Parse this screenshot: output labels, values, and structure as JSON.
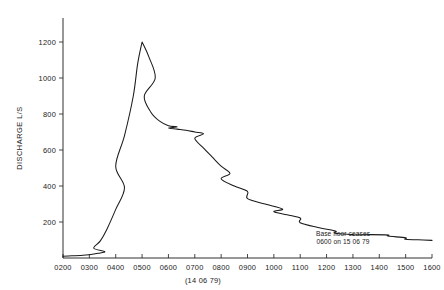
{
  "chart_data": {
    "type": "line",
    "title": "",
    "subtitle": "",
    "xlabel": "(14 06 79)",
    "ylabel": "DISCHARGE L/S",
    "xlim": [
      200,
      1600
    ],
    "ylim": [
      0,
      1240
    ],
    "grid": false,
    "legend_position": "none",
    "x_tick_labels": [
      "0200",
      "0300",
      "0400",
      "0500",
      "0600",
      "0700",
      "0800",
      "0900",
      "1000",
      "1100",
      "1200",
      "1300",
      "1400",
      "1500",
      "1600"
    ],
    "x_tick_values": [
      200,
      300,
      400,
      500,
      600,
      700,
      800,
      900,
      1000,
      1100,
      1200,
      1300,
      1400,
      1500,
      1600
    ],
    "y_tick_labels": [
      "200",
      "400",
      "600",
      "800",
      "1000",
      "1200"
    ],
    "y_tick_values": [
      200,
      400,
      600,
      800,
      1000,
      1200
    ],
    "series": [
      {
        "name": "Discharge",
        "units": "L/S",
        "x": [
          200,
          220,
          240,
          260,
          280,
          295,
          310,
          325,
          340,
          360,
          380,
          400,
          420,
          440,
          450,
          460,
          475,
          490,
          505,
          520,
          540,
          560,
          580,
          600,
          620,
          640,
          660,
          680,
          700,
          720,
          740,
          760,
          780,
          800,
          830,
          860,
          900,
          940,
          980,
          1000,
          1030,
          1060,
          1100,
          1140,
          1180,
          1220,
          1260,
          1300,
          1340,
          1380,
          1420,
          1460,
          1500,
          1540,
          1600
        ],
        "y": [
          10,
          12,
          14,
          18,
          26,
          36,
          55,
          95,
          160,
          270,
          390,
          510,
          680,
          900,
          1080,
          1200,
          1120,
          1000,
          900,
          810,
          760,
          735,
          728,
          722,
          716,
          710,
          700,
          690,
          665,
          610,
          560,
          510,
          470,
          440,
          400,
          370,
          330,
          300,
          272,
          258,
          240,
          222,
          196,
          170,
          150,
          138,
          130,
          128,
          130,
          128,
          122,
          112,
          104,
          100,
          98
        ]
      }
    ],
    "annotations": [
      {
        "name": "base-flow-note",
        "line1": "Base floor ceases",
        "line2": "0600 on 15 06 79",
        "x": 1300,
        "y": 90
      }
    ]
  }
}
